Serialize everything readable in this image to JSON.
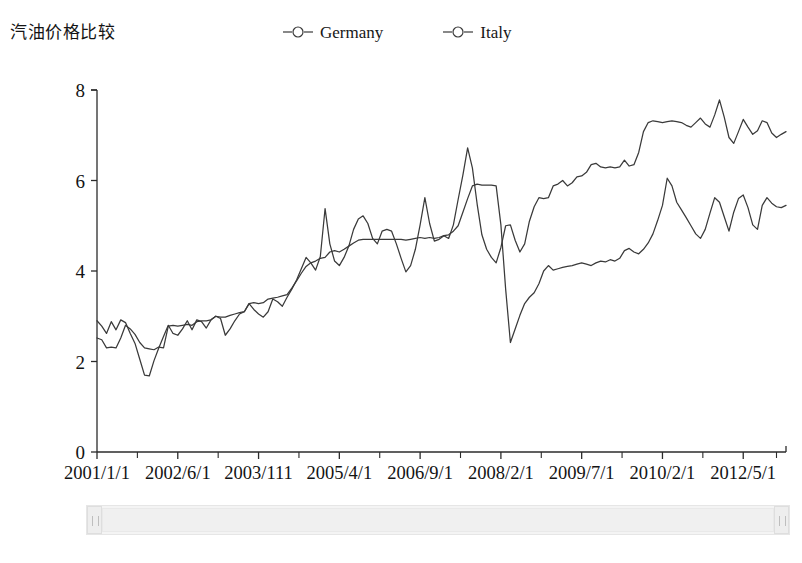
{
  "title": "汽油价格比较",
  "legend": {
    "position": "top-center",
    "marker_icon": "circle-marker-icon",
    "items": [
      {
        "label": "Germany",
        "color": "#3a3a3a"
      },
      {
        "label": "Italy",
        "color": "#3a3a3a"
      }
    ]
  },
  "scrollbar": {
    "left_arrow": "scroll-left-arrow-icon",
    "right_arrow": "scroll-right-arrow-icon"
  },
  "chart_data": {
    "type": "line",
    "title": "汽油价格比较",
    "xlabel": "",
    "ylabel": "",
    "ylim": [
      0,
      8
    ],
    "yticks": [
      0,
      2,
      4,
      6,
      8
    ],
    "grid": false,
    "legend_position": "top-center",
    "x_tick_labels": [
      "2001/1/1",
      "2002/6/1",
      "2003/111",
      "2005/4/1",
      "2006/9/1",
      "2008/2/1",
      "2009/7/1",
      "2010/2/1",
      "2012/5/1"
    ],
    "x_tick_positions": [
      0,
      17,
      34,
      51,
      68,
      85,
      102,
      119,
      136
    ],
    "x_count": 146,
    "series": [
      {
        "name": "Germany",
        "color": "#3a3a3a",
        "values": [
          2.9,
          2.78,
          2.62,
          2.88,
          2.7,
          2.92,
          2.86,
          2.62,
          2.4,
          2.05,
          1.7,
          1.68,
          2.02,
          2.3,
          2.55,
          2.8,
          2.62,
          2.58,
          2.72,
          2.9,
          2.7,
          2.92,
          2.88,
          2.74,
          2.92,
          3.0,
          2.95,
          2.58,
          2.72,
          2.9,
          3.05,
          3.1,
          3.28,
          3.15,
          3.05,
          2.98,
          3.1,
          3.38,
          3.32,
          3.22,
          3.42,
          3.6,
          3.8,
          4.05,
          4.3,
          4.18,
          4.02,
          4.32,
          5.38,
          4.6,
          4.22,
          4.12,
          4.3,
          4.55,
          4.92,
          5.15,
          5.22,
          5.05,
          4.72,
          4.6,
          4.88,
          4.92,
          4.88,
          4.6,
          4.28,
          3.98,
          4.12,
          4.48,
          5.02,
          5.62,
          5.05,
          4.66,
          4.7,
          4.78,
          4.72,
          5.02,
          5.58,
          6.12,
          6.72,
          6.28,
          5.48,
          4.8,
          4.48,
          4.3,
          4.18,
          4.52,
          5.0,
          5.02,
          4.68,
          4.42,
          4.6,
          5.1,
          5.42,
          5.62,
          5.6,
          5.62,
          5.88,
          5.92,
          6.0,
          5.88,
          5.95,
          6.08,
          6.1,
          6.18,
          6.35,
          6.38,
          6.3,
          6.28,
          6.3,
          6.28,
          6.3,
          6.45,
          6.32,
          6.35,
          6.62,
          7.08,
          7.28,
          7.32,
          7.3,
          7.28,
          7.3,
          7.32,
          7.3,
          7.28,
          7.22,
          7.18,
          7.28,
          7.38,
          7.25,
          7.18,
          7.45,
          7.78,
          7.4,
          6.95,
          6.82,
          7.08,
          7.35,
          7.18,
          7.02,
          7.1,
          7.32,
          7.28,
          7.05,
          6.95,
          7.02,
          7.08
        ]
      },
      {
        "name": "Italy",
        "color": "#3a3a3a",
        "values": [
          2.52,
          2.48,
          2.3,
          2.32,
          2.3,
          2.52,
          2.8,
          2.72,
          2.6,
          2.42,
          2.3,
          2.28,
          2.26,
          2.32,
          2.3,
          2.78,
          2.8,
          2.78,
          2.8,
          2.82,
          2.8,
          2.88,
          2.9,
          2.9,
          2.92,
          3.0,
          2.98,
          2.98,
          3.02,
          3.05,
          3.08,
          3.1,
          3.28,
          3.3,
          3.28,
          3.3,
          3.38,
          3.4,
          3.42,
          3.45,
          3.48,
          3.62,
          3.78,
          3.95,
          4.1,
          4.18,
          4.22,
          4.28,
          4.3,
          4.42,
          4.45,
          4.42,
          4.48,
          4.55,
          4.62,
          4.68,
          4.7,
          4.7,
          4.7,
          4.7,
          4.7,
          4.7,
          4.7,
          4.7,
          4.7,
          4.68,
          4.7,
          4.72,
          4.74,
          4.72,
          4.74,
          4.72,
          4.74,
          4.78,
          4.8,
          4.88,
          5.0,
          5.3,
          5.6,
          5.88,
          5.92,
          5.9,
          5.9,
          5.9,
          5.88,
          5.02,
          3.6,
          2.42,
          2.72,
          3.02,
          3.28,
          3.42,
          3.52,
          3.72,
          4.0,
          4.12,
          4.02,
          4.05,
          4.08,
          4.1,
          4.12,
          4.15,
          4.18,
          4.15,
          4.12,
          4.18,
          4.22,
          4.2,
          4.25,
          4.22,
          4.28,
          4.45,
          4.5,
          4.42,
          4.38,
          4.48,
          4.62,
          4.82,
          5.12,
          5.45,
          6.05,
          5.88,
          5.52,
          5.35,
          5.18,
          5.0,
          4.82,
          4.72,
          4.92,
          5.28,
          5.62,
          5.52,
          5.2,
          4.88,
          5.3,
          5.6,
          5.68,
          5.4,
          5.02,
          4.92,
          5.45,
          5.62,
          5.5,
          5.42,
          5.4,
          5.45
        ]
      }
    ]
  }
}
